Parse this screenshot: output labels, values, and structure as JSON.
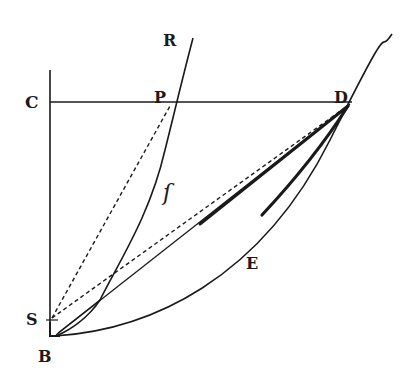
{
  "diagram": {
    "colors": {
      "ink": "#1a1a1a",
      "background": "#ffffff"
    },
    "labels": {
      "C": "C",
      "R": "R",
      "P": "P",
      "D": "D",
      "f": "ſ",
      "E": "E",
      "S": "S",
      "B": "B"
    },
    "points": {
      "C": [
        50,
        102
      ],
      "R": [
        193,
        38
      ],
      "P": [
        172,
        103
      ],
      "D": [
        350,
        103
      ],
      "S": [
        50,
        320
      ],
      "B": [
        55,
        335
      ],
      "E": [
        258,
        245
      ]
    }
  }
}
